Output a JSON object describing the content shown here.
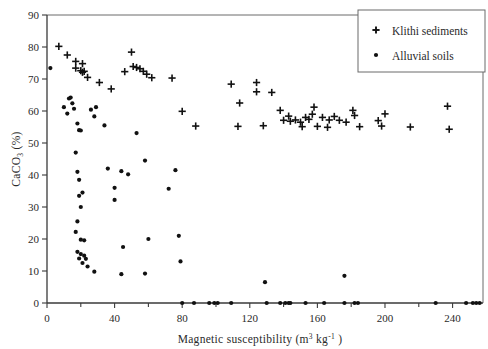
{
  "chart": {
    "type": "scatter",
    "title": "",
    "xlabel_parts": {
      "main": "Magnetic susceptibility",
      "unit_open": "(m",
      "unit_sup1": "3",
      "unit_mid": " kg",
      "unit_sup2": "-1",
      "unit_close": " )"
    },
    "xlabel": "Magnetic susceptibility (m3 kg-1 )",
    "ylabel_parts": {
      "main": "CaCO",
      "sub": "3",
      "unit": " (%)"
    },
    "ylabel": "CaCO3 (%)"
  },
  "axes": {
    "x": {
      "min": 0,
      "max": 258,
      "ticks": [
        0,
        40,
        80,
        120,
        160,
        200,
        240
      ],
      "tick_labels": [
        "0",
        "40",
        "80",
        "120",
        "160",
        "200",
        "240"
      ],
      "minor_step": 20
    },
    "y": {
      "min": 0,
      "max": 90,
      "ticks": [
        0,
        10,
        20,
        30,
        40,
        50,
        60,
        70,
        80,
        90
      ],
      "tick_labels": [
        "0",
        "10",
        "20",
        "30",
        "40",
        "50",
        "60",
        "70",
        "80",
        "90"
      ]
    },
    "grid": false
  },
  "legend": {
    "position": "top-right",
    "entries": [
      {
        "label": "Klithi sediments",
        "marker": "plus-marker-icon"
      },
      {
        "label": "Alluvial soils",
        "marker": "dot-marker-icon"
      }
    ]
  },
  "chart_data": {
    "type": "scatter",
    "title": "",
    "xlabel": "Magnetic susceptibility (m3 kg-1 )",
    "ylabel": "CaCO3 (%)",
    "xlim": [
      0,
      258
    ],
    "ylim": [
      0,
      90
    ],
    "grid": false,
    "legend_position": "top-right",
    "series": [
      {
        "name": "Klithi sediments",
        "marker": "plus",
        "color": "#111111",
        "points": [
          [
            7,
            80.2
          ],
          [
            12,
            77.5
          ],
          [
            17,
            75.5
          ],
          [
            17,
            73.4
          ],
          [
            21,
            74.8
          ],
          [
            20,
            72.6
          ],
          [
            21,
            72.1
          ],
          [
            22,
            72.4
          ],
          [
            24,
            70.5
          ],
          [
            31,
            68.9
          ],
          [
            38,
            66.9
          ],
          [
            50,
            78.4
          ],
          [
            46,
            72.3
          ],
          [
            51,
            73.9
          ],
          [
            53,
            73.6
          ],
          [
            55,
            73.2
          ],
          [
            57,
            72.4
          ],
          [
            59,
            71.5
          ],
          [
            62,
            70.4
          ],
          [
            74,
            70.3
          ],
          [
            80,
            59.9
          ],
          [
            88,
            55.3
          ],
          [
            109,
            68.4
          ],
          [
            114,
            62.5
          ],
          [
            113,
            55.2
          ],
          [
            124,
            68.9
          ],
          [
            124,
            66.0
          ],
          [
            128,
            55.4
          ],
          [
            133,
            65.8
          ],
          [
            138,
            60.2
          ],
          [
            143,
            58.4
          ],
          [
            140,
            57.1
          ],
          [
            144,
            56.8
          ],
          [
            147,
            57.2
          ],
          [
            150,
            56.5
          ],
          [
            151,
            55.1
          ],
          [
            153,
            58.0
          ],
          [
            155,
            57.4
          ],
          [
            157,
            59.0
          ],
          [
            158,
            61.2
          ],
          [
            160,
            55.2
          ],
          [
            163,
            58.0
          ],
          [
            167,
            57.2
          ],
          [
            166,
            54.9
          ],
          [
            170,
            58.3
          ],
          [
            173,
            57.1
          ],
          [
            177,
            56.5
          ],
          [
            181,
            60.2
          ],
          [
            182,
            58.6
          ],
          [
            185,
            55.1
          ],
          [
            196,
            57.0
          ],
          [
            200,
            59.1
          ],
          [
            198,
            55.3
          ],
          [
            215,
            55.0
          ],
          [
            237,
            61.5
          ],
          [
            238,
            54.3
          ]
        ],
        "n": 56
      },
      {
        "name": "Alluvial soils",
        "marker": "dot",
        "color": "#111111",
        "points": [
          [
            2,
            73.4
          ],
          [
            13,
            63.9
          ],
          [
            14,
            64.2
          ],
          [
            15,
            62.4
          ],
          [
            16,
            60.7
          ],
          [
            10,
            61.2
          ],
          [
            12,
            59.2
          ],
          [
            18,
            56.1
          ],
          [
            19,
            54.0
          ],
          [
            20,
            53.9
          ],
          [
            17,
            47.0
          ],
          [
            18,
            41.0
          ],
          [
            19,
            38.5
          ],
          [
            21,
            34.5
          ],
          [
            19,
            33.5
          ],
          [
            20,
            30.0
          ],
          [
            18,
            25.5
          ],
          [
            17,
            22.2
          ],
          [
            20,
            19.8
          ],
          [
            22,
            19.6
          ],
          [
            18,
            16.0
          ],
          [
            20,
            15.3
          ],
          [
            22,
            14.8
          ],
          [
            19,
            13.9
          ],
          [
            23,
            13.8
          ],
          [
            21,
            12.5
          ],
          [
            24,
            11.4
          ],
          [
            26,
            60.4
          ],
          [
            29,
            61.2
          ],
          [
            28,
            58.3
          ],
          [
            28,
            9.8
          ],
          [
            34,
            55.5
          ],
          [
            36,
            42.0
          ],
          [
            40,
            36.0
          ],
          [
            40,
            32.2
          ],
          [
            44,
            41.2
          ],
          [
            48,
            40.2
          ],
          [
            45,
            17.5
          ],
          [
            44,
            9.0
          ],
          [
            53,
            53.1
          ],
          [
            58,
            44.5
          ],
          [
            60,
            20.0
          ],
          [
            58,
            9.2
          ],
          [
            72,
            35.7
          ],
          [
            76,
            41.5
          ],
          [
            78,
            21.0
          ],
          [
            79,
            13.0
          ],
          [
            80,
            0
          ],
          [
            87,
            0
          ],
          [
            96,
            0
          ],
          [
            99,
            0
          ],
          [
            101,
            0
          ],
          [
            109,
            0
          ],
          [
            129,
            6.5
          ],
          [
            130,
            0
          ],
          [
            138,
            0
          ],
          [
            141,
            0
          ],
          [
            143,
            0
          ],
          [
            144,
            0
          ],
          [
            153,
            0
          ],
          [
            164,
            0
          ],
          [
            176,
            8.5
          ],
          [
            176,
            0
          ],
          [
            182,
            0
          ],
          [
            184,
            0
          ],
          [
            230,
            0
          ],
          [
            248,
            0
          ],
          [
            252,
            0
          ],
          [
            254,
            0
          ],
          [
            256,
            0
          ]
        ],
        "n": 70
      }
    ]
  }
}
